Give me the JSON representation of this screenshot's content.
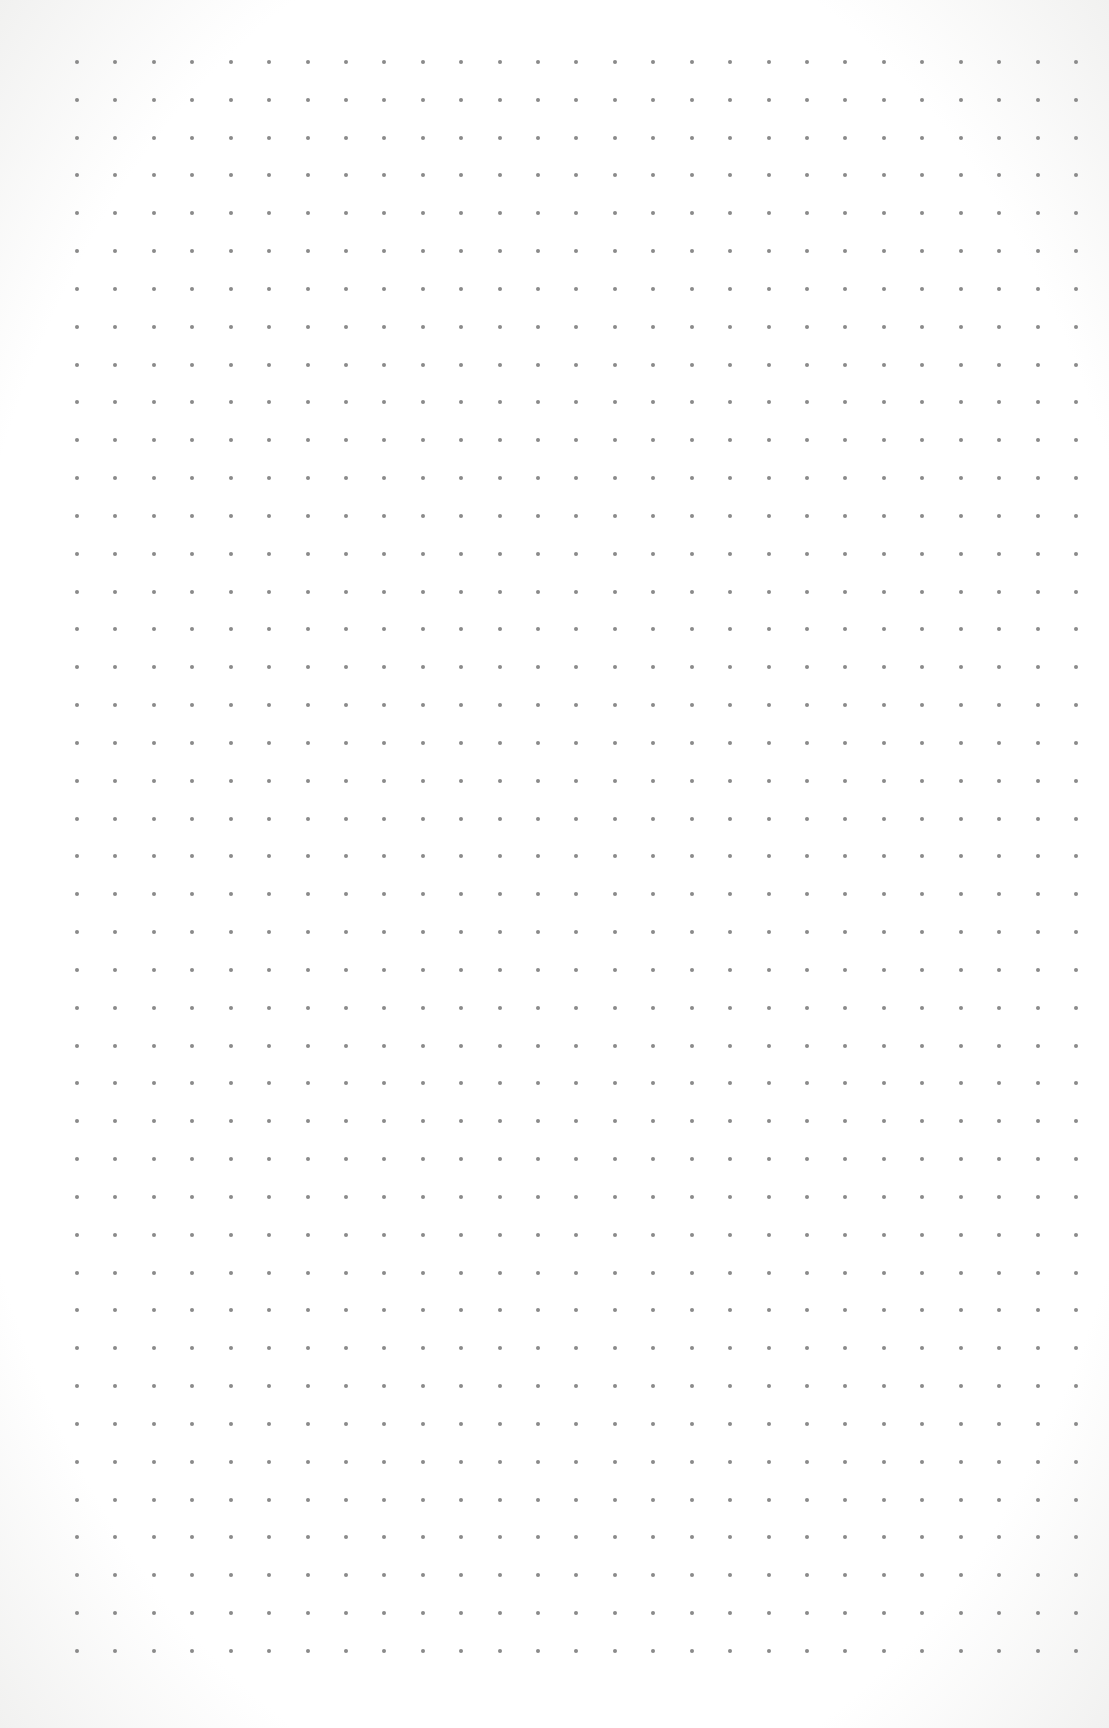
{
  "page": {
    "type": "dot-grid-paper",
    "background_color": "#ffffff",
    "edge_color": "#f1f1f0"
  },
  "grid": {
    "columns": 27,
    "rows": 43,
    "origin_x": 77,
    "origin_y": 62,
    "spacing_x": 38.42,
    "spacing_y": 37.83,
    "dot_diameter": 4,
    "dot_color": "#8a8a8a"
  }
}
